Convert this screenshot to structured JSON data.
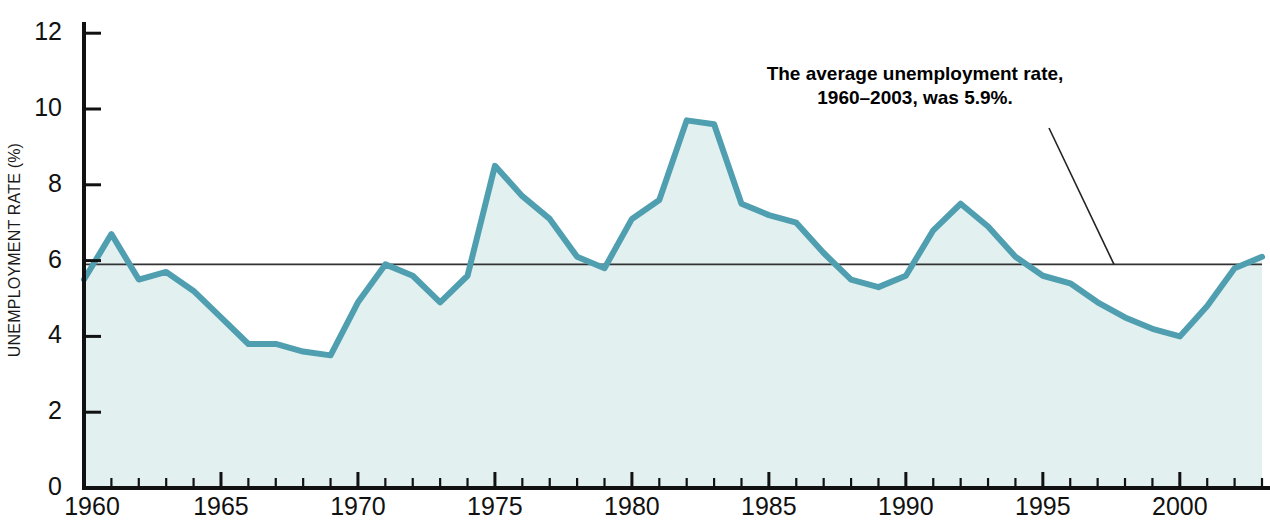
{
  "chart_data": {
    "type": "area",
    "title": "",
    "xlabel": "",
    "ylabel": "UNEMPLOYMENT RATE (%)",
    "xlim": [
      1960,
      2003
    ],
    "ylim": [
      0,
      12.6
    ],
    "grid": false,
    "legend": "none",
    "line_color": "#4f9fb0",
    "fill_color": "#e2f0f0",
    "axis_color": "#111111",
    "reference_line": {
      "label": "average unemployment rate",
      "value": 5.9,
      "color": "#333333"
    },
    "annotation": {
      "line1": "The average unemployment rate,",
      "line2": "1960–2003, was 5.9%.",
      "points_to_value": 5.9
    },
    "y_ticks": [
      0,
      2,
      4,
      6,
      8,
      10,
      12
    ],
    "y_tick_labels": [
      "0",
      "2",
      "4",
      "6",
      "8",
      "10",
      "12"
    ],
    "x_ticks_major": [
      1960,
      1965,
      1970,
      1975,
      1980,
      1985,
      1990,
      1995,
      2000
    ],
    "x_tick_labels": [
      "1960",
      "1965",
      "1970",
      "1975",
      "1980",
      "1985",
      "1990",
      "1995",
      "2000"
    ],
    "x": [
      1960,
      1961,
      1962,
      1963,
      1964,
      1965,
      1966,
      1967,
      1968,
      1969,
      1970,
      1971,
      1972,
      1973,
      1974,
      1975,
      1976,
      1977,
      1978,
      1979,
      1980,
      1981,
      1982,
      1983,
      1984,
      1985,
      1986,
      1987,
      1988,
      1989,
      1990,
      1991,
      1992,
      1993,
      1994,
      1995,
      1996,
      1997,
      1998,
      1999,
      2000,
      2001,
      2002,
      2003
    ],
    "values": [
      5.5,
      6.7,
      5.5,
      5.7,
      5.2,
      4.5,
      3.8,
      3.8,
      3.6,
      3.5,
      4.9,
      5.9,
      5.6,
      4.9,
      5.6,
      8.5,
      7.7,
      7.1,
      6.1,
      5.8,
      7.1,
      7.6,
      9.7,
      9.6,
      7.5,
      7.2,
      7.0,
      6.2,
      5.5,
      5.3,
      5.6,
      6.8,
      7.5,
      6.9,
      6.1,
      5.6,
      5.4,
      4.9,
      4.5,
      4.2,
      4.0,
      4.8,
      5.8,
      6.1
    ],
    "series": [
      {
        "name": "Unemployment rate",
        "values": [
          5.5,
          6.7,
          5.5,
          5.7,
          5.2,
          4.5,
          3.8,
          3.8,
          3.6,
          3.5,
          4.9,
          5.9,
          5.6,
          4.9,
          5.6,
          8.5,
          7.7,
          7.1,
          6.1,
          5.8,
          7.1,
          7.6,
          9.7,
          9.6,
          7.5,
          7.2,
          7.0,
          6.2,
          5.5,
          5.3,
          5.6,
          6.8,
          7.5,
          6.9,
          6.1,
          5.6,
          5.4,
          4.9,
          4.5,
          4.2,
          4.0,
          4.8,
          5.8,
          6.1
        ]
      }
    ]
  }
}
